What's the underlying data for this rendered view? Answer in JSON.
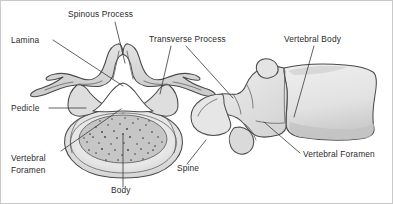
{
  "figure": {
    "width": 393,
    "height": 204,
    "background_color": "#ffffff",
    "border_color": "#c9c9c9"
  },
  "style": {
    "label_color": "#2b2b2b",
    "leader_color": "#3a3a3a",
    "bone_outline_color": "#4a4a4a",
    "bone_fill_light": "#ededed",
    "bone_fill_mid": "#d8d8d8",
    "bone_fill_dark": "#bfbfbf",
    "cancellous_fill": "#c4c4c4",
    "foramen_fill": "#ffffff"
  },
  "labels": [
    {
      "id": "spinous-process",
      "text": "Spinous Process",
      "x": 67,
      "y": 16,
      "anchor": "start"
    },
    {
      "id": "lamina",
      "text": "Lamina",
      "x": 10,
      "y": 42,
      "anchor": "start"
    },
    {
      "id": "transverse-process",
      "text": "Transverse Process",
      "x": 148,
      "y": 41,
      "anchor": "start"
    },
    {
      "id": "vertebral-body",
      "text": "Vertebral Body",
      "x": 283,
      "y": 41,
      "anchor": "start"
    },
    {
      "id": "pedicle",
      "text": "Pedicle",
      "x": 10,
      "y": 110,
      "anchor": "start"
    },
    {
      "id": "vertebral-foramen-superior-line1",
      "text": "Vertebral",
      "x": 10,
      "y": 160,
      "anchor": "start"
    },
    {
      "id": "vertebral-foramen-superior-line2",
      "text": "Foramen",
      "x": 10,
      "y": 172,
      "anchor": "start"
    },
    {
      "id": "body",
      "text": "Body",
      "x": 110,
      "y": 192,
      "anchor": "start"
    },
    {
      "id": "spine",
      "text": "Spine",
      "x": 176,
      "y": 170,
      "anchor": "start"
    },
    {
      "id": "vertebral-foramen-lateral",
      "text": "Vertebral Foramen",
      "x": 302,
      "y": 156,
      "anchor": "start"
    }
  ],
  "leader_lines": [
    {
      "id": "leader-spinous-process",
      "d": "M 114 21 L 124 62"
    },
    {
      "id": "leader-lamina",
      "d": "M 52 39 L 122 85"
    },
    {
      "id": "leader-transverse-process-left",
      "d": "M 170 45 L 159 93"
    },
    {
      "id": "leader-transverse-process-right",
      "d": "M 185 45 L 232 97"
    },
    {
      "id": "leader-vertebral-body",
      "d": "M 313 45 L 293 116"
    },
    {
      "id": "leader-pedicle",
      "d": "M 48 107 L 85 107"
    },
    {
      "id": "leader-vertebral-foramen-superior",
      "d": "M 60 150 L 120 108"
    },
    {
      "id": "leader-body",
      "d": "M 122 186 L 122 133"
    },
    {
      "id": "leader-spine",
      "d": "M 186 163 L 205 139"
    },
    {
      "id": "leader-vertebral-foramen-lateral",
      "d": "M 299 152 L 263 121"
    }
  ],
  "views": [
    {
      "id": "superior-view",
      "name": "superior-view-vertebra",
      "description": "Lumbar vertebra seen from above showing spinous process, laminae, transverse processes, pedicles, vertebral foramen and body with cancellous bone speckling.",
      "parts": [
        "spinous-process",
        "lamina",
        "transverse-process",
        "pedicle",
        "vertebral-foramen",
        "vertebral-body"
      ]
    },
    {
      "id": "lateral-view",
      "name": "lateral-view-vertebra",
      "description": "Lumbar vertebra seen from the side showing the vertebral body, spine (spinous process), transverse process and vertebral foramen.",
      "parts": [
        "vertebral-body",
        "spine",
        "transverse-process",
        "vertebral-foramen"
      ]
    }
  ]
}
